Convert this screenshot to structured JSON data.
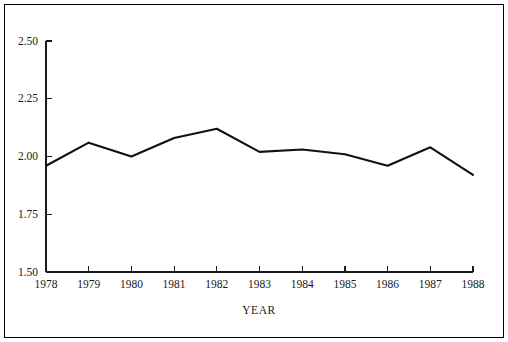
{
  "chart_data": {
    "type": "line",
    "title": "",
    "subtitle": "",
    "xlabel": "YEAR",
    "ylabel": "",
    "x": [
      1978,
      1979,
      1980,
      1981,
      1982,
      1983,
      1984,
      1985,
      1986,
      1987,
      1988
    ],
    "categories": [
      "1978",
      "1979",
      "1980",
      "1981",
      "1982",
      "1983",
      "1984",
      "1985",
      "1986",
      "1987",
      "1988"
    ],
    "values": [
      1.96,
      2.06,
      2.0,
      2.08,
      2.12,
      2.02,
      2.03,
      2.01,
      1.96,
      2.04,
      1.92
    ],
    "series": [
      {
        "name": "",
        "values": [
          1.96,
          2.06,
          2.0,
          2.08,
          2.12,
          2.02,
          2.03,
          2.01,
          1.96,
          2.04,
          1.92
        ]
      }
    ],
    "ylim": [
      1.5,
      2.5
    ],
    "xlim": [
      1978,
      1988
    ],
    "yticks": [
      1.5,
      1.75,
      2.0,
      2.25,
      2.5
    ],
    "ytick_labels": [
      "1.50",
      "1.75",
      "2.00",
      "2.25",
      "2.50"
    ],
    "xtick_labels": [
      "1978",
      "1979",
      "1980",
      "1981",
      "1982",
      "1983",
      "1984",
      "1985",
      "1986",
      "1987",
      "1988"
    ],
    "grid": false,
    "legend": null,
    "legend_position": "none",
    "line_color": "#111111",
    "axis_color": "#1a1a1a",
    "background_color": "#ffffff",
    "border_color": "#000000",
    "annotations": []
  },
  "figure": {
    "border_label": "figure-border"
  }
}
